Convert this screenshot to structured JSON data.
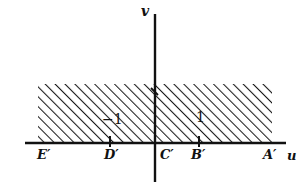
{
  "figure": {
    "background_color": "#ffffff",
    "ink_color": "#111111"
  },
  "axes": {
    "vertical": {
      "label": "v",
      "label_x": 141,
      "label_y": 5,
      "x": 155,
      "y_top": 14,
      "y_bottom": 182
    },
    "horizontal": {
      "label": "u",
      "label_x": 287,
      "label_y": 150,
      "y": 143,
      "x_left": 25,
      "x_right": 286
    }
  },
  "points": [
    {
      "name": "E'",
      "label": "E′",
      "x": 37,
      "y": 148,
      "tick": false
    },
    {
      "name": "D'",
      "label": "D′",
      "x": 104,
      "y": 148,
      "tick": true,
      "tick_x": 110
    },
    {
      "name": "C'",
      "label": "C′",
      "x": 160,
      "y": 148,
      "tick": true,
      "tick_x": 155
    },
    {
      "name": "B'",
      "label": "B′",
      "x": 191,
      "y": 148,
      "tick": true,
      "tick_x": 199
    },
    {
      "name": "A'",
      "label": "A′",
      "x": 263,
      "y": 148,
      "tick": false
    }
  ],
  "value_labels": [
    {
      "name": "minus-one",
      "text": "−1",
      "x": 102,
      "y": 112
    },
    {
      "name": "one",
      "text": "1",
      "x": 196,
      "y": 110
    }
  ],
  "shaded_region": {
    "name": "hatched-strip",
    "x": 38,
    "y": 84,
    "width": 234,
    "height": 59,
    "hatch_angle_deg": 45,
    "hatch_spacing_px": 7,
    "hatch_color": "#1a1a1a",
    "fill_color": "#ffffff"
  },
  "chart_data": {
    "type": "scatter",
    "xlabel": "u",
    "ylabel": "v",
    "grid": false,
    "legend": null,
    "xlim": [
      -3.8,
      4.1
    ],
    "ylim": [
      -1.0,
      3.0
    ],
    "annotations": [
      {
        "text": "−1",
        "x": -1,
        "y": 0.55
      },
      {
        "text": "1",
        "x": 1,
        "y": 0.6
      }
    ],
    "tick_labels_x": [
      "E′",
      "D′",
      "C′",
      "B′",
      "A′"
    ],
    "tick_values_x": [
      -3.3,
      -1.0,
      0.0,
      1.0,
      3.3
    ],
    "shaded_regions": [
      {
        "label": "hatched strip",
        "x_range": [
          -3.45,
          3.8
        ],
        "y_range": [
          0.0,
          1.0
        ],
        "hatch": "///"
      }
    ]
  }
}
